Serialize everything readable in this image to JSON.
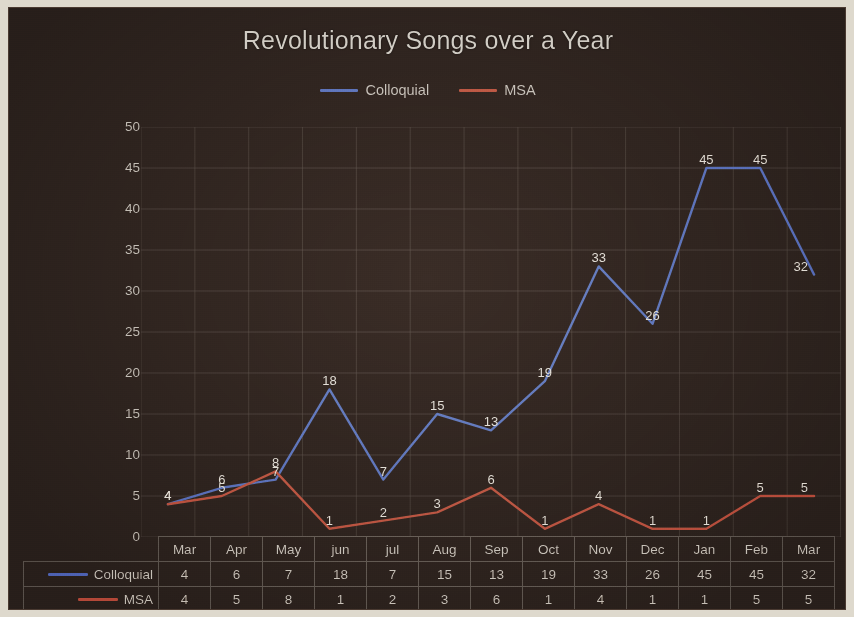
{
  "chart_data": {
    "type": "line",
    "title": "Revolutionary Songs over a Year",
    "xlabel": "",
    "ylabel": "",
    "ylim": [
      0,
      50
    ],
    "ytick_step": 5,
    "yticks": [
      "50",
      "45",
      "40",
      "35",
      "30",
      "25",
      "20",
      "15",
      "10",
      "5",
      "0"
    ],
    "grid": true,
    "legend_position": "top-center",
    "show_data_labels": true,
    "show_data_table": true,
    "categories": [
      "Mar",
      "Apr",
      "May",
      "jun",
      "jul",
      "Aug",
      "Sep",
      "Oct",
      "Nov",
      "Dec",
      "Jan",
      "Feb",
      "Mar"
    ],
    "series": [
      {
        "name": "Colloquial",
        "color": "#6e86c4",
        "values": [
          4,
          6,
          7,
          18,
          7,
          15,
          13,
          19,
          33,
          26,
          45,
          45,
          32
        ]
      },
      {
        "name": "MSA",
        "color": "#c5664f",
        "values": [
          4,
          5,
          8,
          1,
          2,
          3,
          6,
          1,
          4,
          1,
          1,
          5,
          5
        ]
      }
    ]
  },
  "colors": {
    "background": "#382b25",
    "gridline": "#6d6158",
    "axis_text": "#cdc8c1",
    "title_text": "#d8d4cd",
    "table_border": "#7d7269",
    "series_colloquial": "#6e86c4",
    "series_msa": "#c5664f"
  }
}
